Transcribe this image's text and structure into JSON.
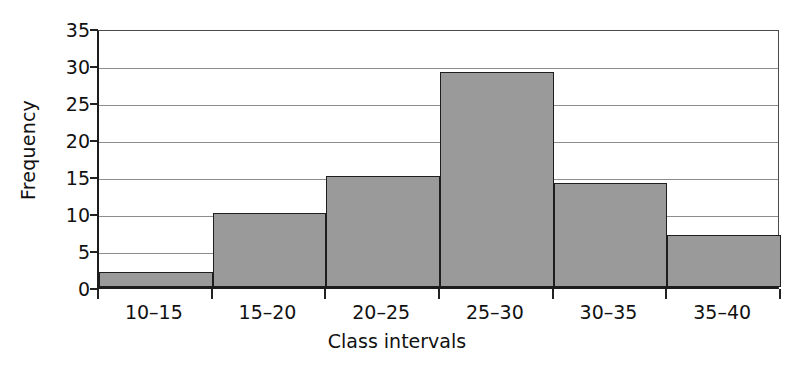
{
  "chart_data": {
    "type": "bar",
    "title": "",
    "xlabel": "Class intervals",
    "ylabel": "Frequency",
    "categories": [
      "10–15",
      "15–20",
      "20–25",
      "25–30",
      "30–35",
      "35–40"
    ],
    "values": [
      2,
      10,
      15,
      29,
      14,
      7
    ],
    "ylim": [
      0,
      35
    ],
    "yticks": [
      0,
      5,
      10,
      15,
      20,
      25,
      30,
      35
    ],
    "ytick_labels": [
      "0",
      "5",
      "10",
      "15",
      "20",
      "25",
      "30",
      "35"
    ],
    "grid": true,
    "grid_axis": "y",
    "legend": false,
    "legend_position": "none",
    "bar_fill_color": "#9a9a9a",
    "bar_edge_color": "#1e1e1e",
    "axis_color": "#1c1c1c",
    "grid_color": "#8d8d8d",
    "background_color": "#ffffff",
    "bar_gap": 0
  }
}
